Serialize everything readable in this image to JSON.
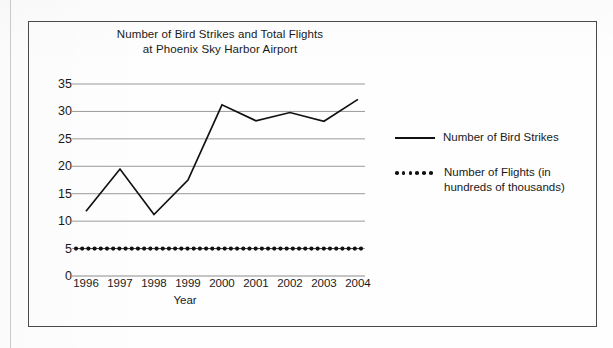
{
  "figure": {
    "title_line1": "Number of Bird Strikes and Total Flights",
    "title_line2": "at Phoenix Sky Harbor Airport"
  },
  "chart_data": {
    "type": "line",
    "title": "Number of Bird Strikes and Total Flights at Phoenix Sky Harbor Airport",
    "xlabel": "Year",
    "ylabel": "",
    "categories": [
      "1996",
      "1997",
      "1998",
      "1999",
      "2000",
      "2001",
      "2002",
      "2003",
      "2004"
    ],
    "yticks": [
      "0",
      "5",
      "10",
      "15",
      "20",
      "25",
      "30",
      "35"
    ],
    "ylim": [
      0,
      35
    ],
    "grid": true,
    "legend_position": "right",
    "series": [
      {
        "name": "Number of Bird Strikes",
        "style": "solid",
        "color": "#111111",
        "values": [
          11.8,
          19.5,
          11.2,
          17.5,
          31.2,
          28.3,
          29.8,
          28.2,
          32.2
        ]
      },
      {
        "name": "Number of Flights (in hundreds of thousands)",
        "name_line1": "Number of Flights (in",
        "name_line2": "hundreds of thousands)",
        "style": "dotted",
        "color": "#111111",
        "values": [
          5,
          5,
          5,
          5,
          5,
          5,
          5,
          5,
          5
        ]
      }
    ]
  }
}
